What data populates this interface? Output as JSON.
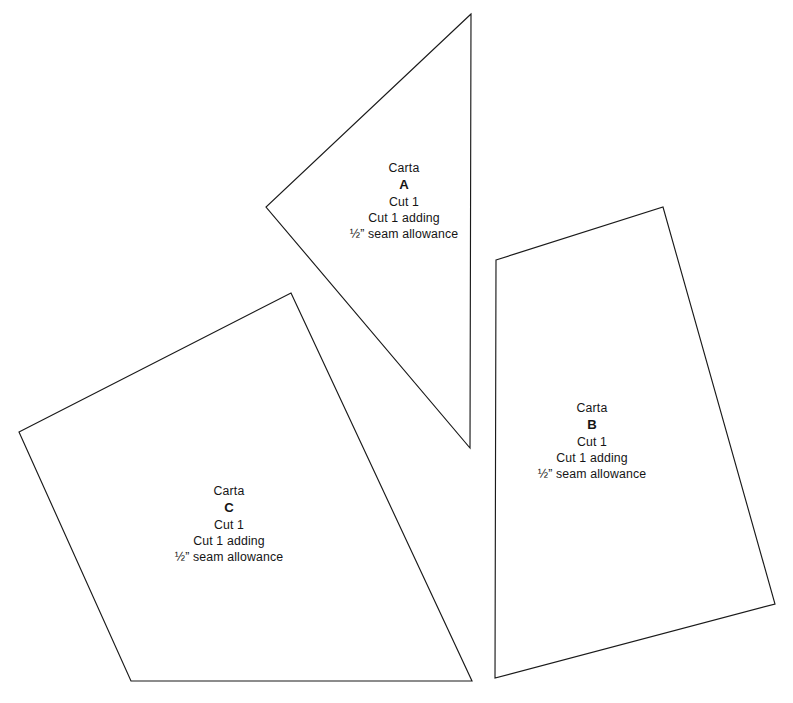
{
  "document": {
    "type": "sewing-pattern-template-sheet",
    "background_color": "#ffffff",
    "line_color": "#1a1a1a",
    "text_color": "#151515",
    "width": 793,
    "height": 703
  },
  "pieces": [
    {
      "id": "A",
      "letter": "A",
      "brand": "Carta",
      "cut": "Cut 1",
      "cut_adding": "Cut 1 adding",
      "seam": "½” seam allowance",
      "shape": "triangle",
      "points": "471,14 266,207 470,448",
      "label_center_x": 404,
      "label_center_y": 201
    },
    {
      "id": "B",
      "letter": "B",
      "brand": "Carta",
      "cut": "Cut 1",
      "cut_adding": "Cut 1 adding",
      "seam": "½” seam allowance",
      "shape": "quadrilateral",
      "points": "496,260 663,207 775,604 495,678",
      "label_center_x": 592,
      "label_center_y": 441
    },
    {
      "id": "C",
      "letter": "C",
      "brand": "Carta",
      "cut": "Cut 1",
      "cut_adding": "Cut 1 adding",
      "seam": "½” seam allowance",
      "shape": "quadrilateral",
      "points": "291,293 472,681 131,681 19,432",
      "label_center_x": 229,
      "label_center_y": 524
    }
  ]
}
